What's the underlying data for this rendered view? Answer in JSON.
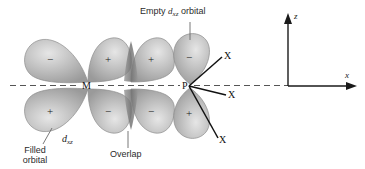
{
  "figure": {
    "background_color": "#ffffff",
    "ink_color": "#1a1a1a",
    "lobe_fill": "#b9b9b9",
    "lobe_edge": "#8f8f8f",
    "overlap_color": "#8a8a8a",
    "annotations": {
      "empty_orbital": {
        "line1": "Empty",
        "orbital_symbol": "d",
        "orbital_subscript": "xz",
        "line2": "orbital"
      },
      "filled_orbital": {
        "line1": "Filled",
        "line2": "orbital"
      },
      "orbital_label": {
        "symbol": "d",
        "subscript": "xz"
      },
      "overlap": "Overlap"
    },
    "atoms": [
      {
        "label": "M",
        "role": "metal-center"
      },
      {
        "label": "P",
        "role": "phosphorus-center"
      }
    ],
    "substituents": [
      {
        "label": "X",
        "position": "upper-right"
      },
      {
        "label": "X",
        "position": "right"
      },
      {
        "label": "X",
        "position": "lower-right"
      }
    ],
    "lobe_signs": {
      "metal_top_left": "−",
      "metal_top_right": "+",
      "phosphorus_overlap_top": "+",
      "metal_bottom_left": "+",
      "metal_bottom_right": "−",
      "phosphorus_overlap_bottom": "−",
      "p_orbital_top": "−",
      "p_orbital_bottom": "+"
    },
    "axes": {
      "vertical_label": "z",
      "horizontal_label": "x"
    }
  }
}
